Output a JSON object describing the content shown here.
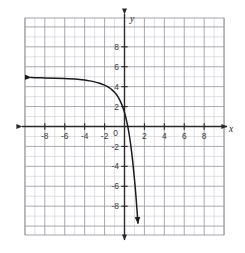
{
  "figure": {
    "title": "",
    "background_color": "#ffffff"
  },
  "chart_data": {
    "type": "line",
    "title": "",
    "xlabel": "x",
    "ylabel": "y",
    "xlim": [
      -10,
      10
    ],
    "ylim": [
      -10,
      10
    ],
    "grid": true,
    "grid_minor_step": 1,
    "grid_major_step": 2,
    "legend": "none",
    "x_tick_labels": [
      "-8",
      "-6",
      "-4",
      "-2",
      "0",
      "2",
      "4",
      "6",
      "8"
    ],
    "x_tick_values": [
      -8,
      -6,
      -4,
      -2,
      0,
      2,
      4,
      6,
      8
    ],
    "y_tick_labels": [
      "8",
      "6",
      "4",
      "2",
      "-2",
      "-4",
      "-6",
      "-8"
    ],
    "y_tick_values": [
      8,
      6,
      4,
      2,
      -2,
      -4,
      -6,
      -8
    ],
    "origin_label": "0",
    "curve": {
      "name": "exponential-decay-reflected",
      "description": "Decreasing curve with horizontal asymptote y = 5 at left, falling steeply through the fourth quadrant",
      "horizontal_asymptote": 5,
      "y_intercept": 2.3,
      "x_intercept": 0.7,
      "color": "#1c1c1c",
      "line_width": 1.5,
      "arrow_start": "left",
      "arrow_end": "down",
      "points": [
        [
          -9.4,
          4.92
        ],
        [
          -9.0,
          4.9
        ],
        [
          -8.0,
          4.88
        ],
        [
          -7.0,
          4.85
        ],
        [
          -6.0,
          4.81
        ],
        [
          -5.0,
          4.76
        ],
        [
          -4.5,
          4.72
        ],
        [
          -4.0,
          4.66
        ],
        [
          -3.5,
          4.58
        ],
        [
          -3.0,
          4.48
        ],
        [
          -2.5,
          4.34
        ],
        [
          -2.0,
          4.16
        ],
        [
          -1.75,
          4.03
        ],
        [
          -1.5,
          3.88
        ],
        [
          -1.25,
          3.68
        ],
        [
          -1.0,
          3.44
        ],
        [
          -0.85,
          3.26
        ],
        [
          -0.7,
          3.05
        ],
        [
          -0.55,
          2.8
        ],
        [
          -0.4,
          2.5
        ],
        [
          -0.25,
          2.15
        ],
        [
          -0.1,
          1.72
        ],
        [
          0.0,
          1.4
        ],
        [
          0.1,
          1.03
        ],
        [
          0.2,
          0.62
        ],
        [
          0.3,
          0.15
        ],
        [
          0.4,
          -0.38
        ],
        [
          0.5,
          -0.98
        ],
        [
          0.65,
          -2.05
        ],
        [
          0.8,
          -3.3
        ],
        [
          0.95,
          -4.75
        ],
        [
          1.1,
          -6.4
        ],
        [
          1.2,
          -7.65
        ],
        [
          1.3,
          -9.0
        ],
        [
          1.35,
          -9.7
        ]
      ]
    }
  },
  "colors": {
    "grid_minor": "#c8c8cf",
    "grid_major": "#9a9aa4",
    "axis": "#2a2a2a",
    "curve": "#1c1c1c",
    "tick_text": "#3a3a3a",
    "plot_background": "#ffffff"
  },
  "axes": {
    "x_axis_name": "x",
    "y_axis_name": "y",
    "x_arrow_left": true,
    "x_arrow_right": true,
    "y_arrow_up": true,
    "y_arrow_down": true
  }
}
